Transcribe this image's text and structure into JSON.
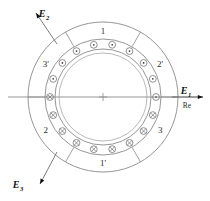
{
  "figure": {
    "center_mark": "+",
    "geometry": {
      "cx": 103,
      "cy": 97,
      "r_outer": 75,
      "r_backiron": 58,
      "r_bore_outer": 48,
      "r_bore_inner": 44,
      "r_conductors": 53,
      "conductor_radius": 3.4,
      "sector_count": 6,
      "conductors_total": 18
    },
    "colors": {
      "line": "#8a8a8a",
      "text": "#2b2b2b",
      "arrow": "#111111",
      "background": "#ffffff"
    }
  },
  "sectors": [
    {
      "id": "s1",
      "label": "1",
      "angle_deg": 90,
      "label_r": 66,
      "polarity": "out"
    },
    {
      "id": "s3p",
      "label": "3'",
      "angle_deg": 150,
      "label_r": 66,
      "polarity": "out"
    },
    {
      "id": "s2",
      "label": "2",
      "angle_deg": 210,
      "label_r": 66,
      "polarity": "in"
    },
    {
      "id": "s1p",
      "label": "1'",
      "angle_deg": 270,
      "label_r": 66,
      "polarity": "in"
    },
    {
      "id": "s3",
      "label": "3",
      "angle_deg": 330,
      "label_r": 66,
      "polarity": "in"
    },
    {
      "id": "s2p",
      "label": "2'",
      "angle_deg": 30,
      "label_r": 66,
      "polarity": "out"
    }
  ],
  "divider_angles_deg": [
    0,
    60,
    120,
    180,
    240,
    300
  ],
  "conductors": [
    {
      "angle_deg": 100,
      "polarity": "out"
    },
    {
      "angle_deg": 80,
      "polarity": "out"
    },
    {
      "angle_deg": 60,
      "polarity": "out"
    },
    {
      "angle_deg": 40,
      "polarity": "out"
    },
    {
      "angle_deg": 20,
      "polarity": "out"
    },
    {
      "angle_deg": 0,
      "polarity": "out"
    },
    {
      "angle_deg": 340,
      "polarity": "in"
    },
    {
      "angle_deg": 320,
      "polarity": "in"
    },
    {
      "angle_deg": 300,
      "polarity": "in"
    },
    {
      "angle_deg": 280,
      "polarity": "in"
    },
    {
      "angle_deg": 260,
      "polarity": "in"
    },
    {
      "angle_deg": 240,
      "polarity": "in"
    },
    {
      "angle_deg": 220,
      "polarity": "in"
    },
    {
      "angle_deg": 200,
      "polarity": "in"
    },
    {
      "angle_deg": 180,
      "polarity": "in"
    },
    {
      "angle_deg": 160,
      "polarity": "out"
    },
    {
      "angle_deg": 140,
      "polarity": "out"
    },
    {
      "angle_deg": 120,
      "polarity": "out"
    }
  ],
  "phasors": [
    {
      "id": "e1",
      "base": "E",
      "sub": "1",
      "axis_label": "Re",
      "direction_deg": 0,
      "label_x": 186,
      "label_y": 94,
      "sub_dx": 8,
      "sub_dy": 3,
      "axis_x": 187,
      "axis_y": 108,
      "line": {
        "x1": 172,
        "y1": 97,
        "x2": 203,
        "y2": 97
      }
    },
    {
      "id": "e2",
      "base": "E",
      "sub": "2",
      "axis_label": "",
      "direction_deg": 135,
      "label_x": 44,
      "label_y": 17,
      "sub_dx": 8,
      "sub_dy": 3,
      "line": {
        "x1": 57,
        "y1": 44,
        "x2": 36,
        "y2": 13
      }
    },
    {
      "id": "e3",
      "base": "E",
      "sub": "3",
      "axis_label": "",
      "direction_deg": 225,
      "label_x": 18,
      "label_y": 188,
      "sub_dx": 8,
      "sub_dy": 3,
      "line": {
        "x1": 57,
        "y1": 152,
        "x2": 40,
        "y2": 184
      }
    }
  ],
  "axis_line": {
    "x1": 8,
    "y1": 97,
    "x2": 203,
    "y2": 97
  }
}
